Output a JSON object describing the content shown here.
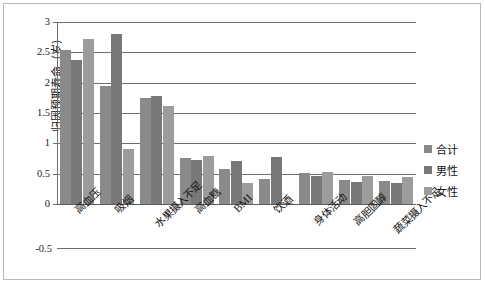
{
  "chart_data": {
    "type": "bar",
    "title": "",
    "xlabel": "",
    "ylabel": "归因预期寿命（岁）",
    "ylim": [
      -0.5,
      3
    ],
    "yticks": [
      "3",
      "2.5",
      "2",
      "1.5",
      "1",
      "0.5",
      "0",
      "-0.5"
    ],
    "grid": true,
    "legend_position": "right",
    "categories": [
      "高血压",
      "吸烟",
      "水果摄入不足",
      "高血糖",
      "BMI",
      "饮酒",
      "身体活动",
      "高胆固醇",
      "蔬菜摄入不足"
    ],
    "series": [
      {
        "name": "合计",
        "color": "#8a8a8a",
        "values": [
          2.54,
          1.95,
          1.74,
          0.76,
          0.57,
          0.42,
          0.51,
          0.4,
          0.38
        ]
      },
      {
        "name": "男性",
        "color": "#787878",
        "values": [
          2.37,
          2.8,
          1.78,
          0.73,
          0.71,
          0.78,
          0.47,
          0.36,
          0.35
        ]
      },
      {
        "name": "女性",
        "color": "#9c9c9c",
        "values": [
          2.72,
          0.9,
          1.62,
          0.79,
          0.35,
          0.02,
          0.53,
          0.46,
          0.44
        ]
      }
    ]
  },
  "legend": {
    "items": [
      {
        "label": "合计",
        "color": "#8a8a8a"
      },
      {
        "label": "男性",
        "color": "#787878"
      },
      {
        "label": "女性",
        "color": "#9c9c9c"
      }
    ]
  }
}
